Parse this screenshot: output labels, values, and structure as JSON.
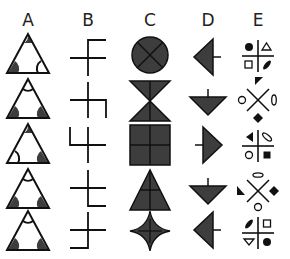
{
  "columns": [
    {
      "label": "A",
      "x": 28
    },
    {
      "label": "B",
      "x": 88
    },
    {
      "label": "C",
      "x": 150
    },
    {
      "label": "D",
      "x": 208
    },
    {
      "label": "E",
      "x": 258
    }
  ],
  "row_centers_y": [
    55,
    100,
    145,
    190,
    232
  ],
  "colors": {
    "fill": "#3d3d3d",
    "stroke": "#111111",
    "background": "#ffffff"
  },
  "rows": [
    {
      "A": {
        "corners": {
          "top": "filled",
          "bottom_left": "filled",
          "bottom_right": "arc"
        }
      },
      "B": {
        "bent_arm": "top",
        "bend_direction": "right"
      },
      "C": {
        "shape": "circle-with-x"
      },
      "D": {
        "triangle_points": "left",
        "tick": "right"
      },
      "E": {
        "divider": "plus",
        "TL": "filled-circle",
        "TR": "outline-triangle-up",
        "BL": "outline-square",
        "BR": "filled-slanted-ellipse"
      }
    },
    {
      "A": {
        "corners": {
          "top": "arc",
          "bottom_left": "filled",
          "bottom_right": "filled"
        }
      },
      "B": {
        "bent_arm": "right",
        "bend_direction": "down"
      },
      "C": {
        "shape": "hourglass-with-vertical-line"
      },
      "D": {
        "triangle_points": "down",
        "tick": "up"
      },
      "E": {
        "divider": "x",
        "top": "filled-right-triangle",
        "left": "outline-circle",
        "right": "outline-vertical-ellipse",
        "bottom": "filled-diamond"
      }
    },
    {
      "A": {
        "corners": {
          "top": "filled",
          "bottom_left": "arc",
          "bottom_right": "filled"
        }
      },
      "B": {
        "bent_arm": "left",
        "bend_direction": "up"
      },
      "C": {
        "shape": "square-with-plus"
      },
      "D": {
        "triangle_points": "right",
        "tick": "left"
      },
      "E": {
        "divider": "plus",
        "TL": "filled-triangle-left",
        "TR": "outline-slanted-ellipse",
        "BL": "outline-circle",
        "BR": "filled-square"
      }
    },
    {
      "A": {
        "corners": {
          "top": "arc",
          "bottom_left": "filled",
          "bottom_right": "filled"
        }
      },
      "B": {
        "bent_arm": "bottom",
        "bend_direction": "right"
      },
      "C": {
        "shape": "triangle-with-plus"
      },
      "D": {
        "triangle_points": "down",
        "tick": "up"
      },
      "E": {
        "divider": "x",
        "top": "outline-horizontal-ellipse",
        "left": "filled-right-triangle",
        "right": "filled-diamond",
        "bottom": "outline-circle"
      }
    },
    {
      "A": {
        "corners": {
          "top": "arc",
          "bottom_left": "filled",
          "bottom_right": "filled"
        }
      },
      "B": {
        "bent_arm": "bottom",
        "bend_direction": "left"
      },
      "C": {
        "shape": "four-point-star-with-plus"
      },
      "D": {
        "triangle_points": "left",
        "tick": "right"
      },
      "E": {
        "divider": "plus",
        "TL": "filled-slanted-ellipse",
        "TR": "outline-square",
        "BL": "outline-triangle-down",
        "BR": "filled-circle"
      }
    }
  ]
}
